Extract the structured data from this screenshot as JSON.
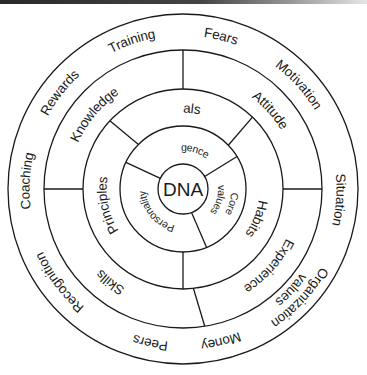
{
  "diagram": {
    "title": "",
    "center": {
      "label": "DNA"
    },
    "rings": [
      {
        "level": 1,
        "segments": [
          {
            "label": "Intelligence"
          },
          {
            "label": "Core values",
            "lines": [
              "Core",
              "values"
            ]
          },
          {
            "label": "Personality"
          }
        ]
      },
      {
        "level": 2,
        "segments": [
          {
            "label": "Goals"
          },
          {
            "label": "Habits"
          },
          {
            "label": "Principles"
          }
        ]
      },
      {
        "level": 3,
        "segments": [
          {
            "label": "Attitude"
          },
          {
            "label": "Experience"
          },
          {
            "label": "Skills"
          },
          {
            "label": "Knowledge"
          }
        ]
      },
      {
        "level": 4,
        "segments": [
          {
            "label": "Fears"
          },
          {
            "label": "Motivation"
          },
          {
            "label": "Situation"
          },
          {
            "label": "Organization values",
            "lines": [
              "Organization",
              "values"
            ]
          },
          {
            "label": "Money"
          },
          {
            "label": "Peers"
          },
          {
            "label": "Recognition"
          },
          {
            "label": "Coaching"
          },
          {
            "label": "Rewards"
          },
          {
            "label": "Training"
          }
        ]
      }
    ],
    "colors": {
      "stroke": "#1a1a1a",
      "text": "#1a1a1a",
      "background": "#ffffff"
    }
  }
}
